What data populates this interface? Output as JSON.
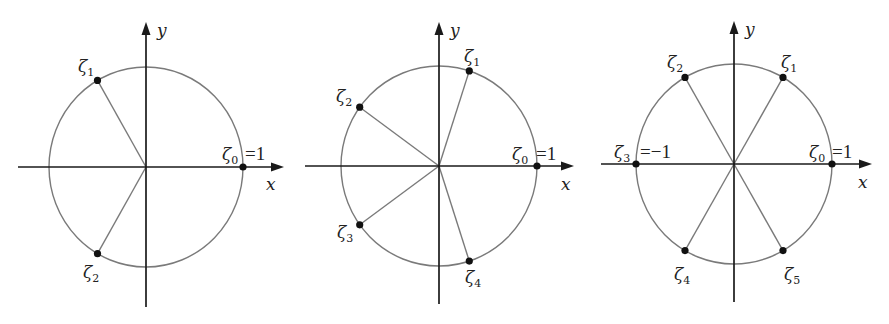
{
  "figure": {
    "width": 889,
    "height": 324,
    "colors": {
      "circle": "#7a7a7a",
      "axes": "#1a1a1a",
      "points": "#111111",
      "text": "#222222"
    }
  },
  "diagrams": [
    {
      "name": "roots-of-unity-n3",
      "n": 3,
      "center": [
        146,
        167
      ],
      "radius": [
        97,
        100
      ],
      "x_axis": {
        "from": 18,
        "to": 284,
        "label": "x",
        "label_pos": [
          266,
          190
        ]
      },
      "y_axis": {
        "from": 307,
        "to": 22,
        "label": "y",
        "label_pos": [
          157,
          36
        ]
      },
      "points": [
        {
          "symbol": "ζ",
          "index": "0",
          "suffix": "=1",
          "angle_deg": 0,
          "label_pos": [
            222,
            160
          ],
          "suffix_pos": [
            245,
            160
          ]
        },
        {
          "symbol": "ζ",
          "index": "1",
          "suffix": "",
          "angle_deg": 120,
          "label_pos": [
            78,
            72
          ]
        },
        {
          "symbol": "ζ",
          "index": "2",
          "suffix": "",
          "angle_deg": 240,
          "label_pos": [
            83,
            278
          ]
        }
      ]
    },
    {
      "name": "roots-of-unity-n5",
      "n": 5,
      "center": [
        439,
        166
      ],
      "radius": [
        98,
        100
      ],
      "x_axis": {
        "from": 305,
        "to": 574,
        "label": "x",
        "label_pos": [
          561,
          190
        ]
      },
      "y_axis": {
        "from": 304,
        "to": 22,
        "label": "y",
        "label_pos": [
          450,
          36
        ]
      },
      "points": [
        {
          "symbol": "ζ",
          "index": "0",
          "suffix": "=1",
          "angle_deg": 0,
          "label_pos": [
            512,
            160
          ],
          "suffix_pos": [
            536,
            160
          ]
        },
        {
          "symbol": "ζ",
          "index": "1",
          "suffix": "",
          "angle_deg": 72,
          "label_pos": [
            464,
            62
          ]
        },
        {
          "symbol": "ζ",
          "index": "2",
          "suffix": "",
          "angle_deg": 144,
          "label_pos": [
            336,
            102
          ]
        },
        {
          "symbol": "ζ",
          "index": "3",
          "suffix": "",
          "angle_deg": 216,
          "label_pos": [
            337,
            238
          ]
        },
        {
          "symbol": "ζ",
          "index": "4",
          "suffix": "",
          "angle_deg": 288,
          "label_pos": [
            465,
            283
          ]
        }
      ]
    },
    {
      "name": "roots-of-unity-n6",
      "n": 6,
      "center": [
        734,
        164
      ],
      "radius": [
        98,
        100
      ],
      "x_axis": {
        "from": 601,
        "to": 872,
        "label": "x",
        "label_pos": [
          858,
          188
        ]
      },
      "y_axis": {
        "from": 302,
        "to": 21,
        "label": "y",
        "label_pos": [
          745,
          35
        ]
      },
      "points": [
        {
          "symbol": "ζ",
          "index": "0",
          "suffix": "=1",
          "angle_deg": 0,
          "label_pos": [
            809,
            158
          ],
          "suffix_pos": [
            832,
            158
          ]
        },
        {
          "symbol": "ζ",
          "index": "1",
          "suffix": "",
          "angle_deg": 60,
          "label_pos": [
            781,
            68
          ]
        },
        {
          "symbol": "ζ",
          "index": "2",
          "suffix": "",
          "angle_deg": 120,
          "label_pos": [
            667,
            68
          ]
        },
        {
          "symbol": "ζ",
          "index": "3",
          "suffix": "=−1",
          "angle_deg": 180,
          "label_pos": [
            614,
            158
          ],
          "suffix_pos": [
            640,
            158
          ]
        },
        {
          "symbol": "ζ",
          "index": "4",
          "suffix": "",
          "angle_deg": 240,
          "label_pos": [
            674,
            280
          ]
        },
        {
          "symbol": "ζ",
          "index": "5",
          "suffix": "",
          "angle_deg": 300,
          "label_pos": [
            784,
            280
          ]
        }
      ]
    }
  ]
}
